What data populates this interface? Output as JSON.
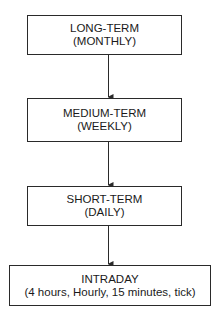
{
  "diagram": {
    "type": "flowchart",
    "direction": "top-to-bottom",
    "nodes": [
      {
        "id": "long",
        "title": "LONG-TERM",
        "subtitle": "(MONTHLY)"
      },
      {
        "id": "medium",
        "title": "MEDIUM-TERM",
        "subtitle": "(WEEKLY)"
      },
      {
        "id": "short",
        "title": "SHORT-TERM",
        "subtitle": "(DAILY)"
      },
      {
        "id": "intraday",
        "title": "INTRADAY",
        "subtitle": "(4 hours, Hourly, 15 minutes, tick)"
      }
    ],
    "edges": [
      {
        "from": "long",
        "to": "medium"
      },
      {
        "from": "medium",
        "to": "short"
      },
      {
        "from": "short",
        "to": "intraday"
      }
    ],
    "colors": {
      "line": "#2a2a2a",
      "background": "#ffffff",
      "text": "#1a1a1a"
    }
  }
}
